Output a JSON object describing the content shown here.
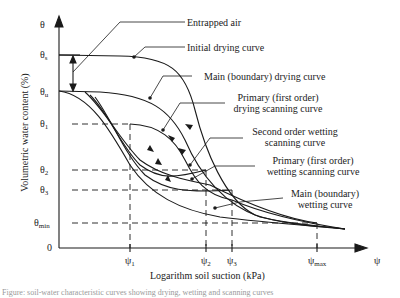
{
  "figure": {
    "y_axis_title": "Volumetric water content (%)",
    "x_axis_title": "Logarithm soil suction (kPa)",
    "y_ticks": [
      {
        "id": "theta",
        "base": "θ",
        "sub": ""
      },
      {
        "id": "theta_s",
        "base": "θ",
        "sub": "s"
      },
      {
        "id": "theta_u",
        "base": "θ",
        "sub": "u"
      },
      {
        "id": "theta_1",
        "base": "θ",
        "sub": "1"
      },
      {
        "id": "theta_2",
        "base": "θ",
        "sub": "2"
      },
      {
        "id": "theta_3",
        "base": "θ",
        "sub": "3"
      },
      {
        "id": "theta_min",
        "base": "θ",
        "sub": "min"
      },
      {
        "id": "zero",
        "base": "0",
        "sub": ""
      }
    ],
    "x_ticks": [
      {
        "id": "psi_1",
        "base": "ψ",
        "sub": "1"
      },
      {
        "id": "psi_2",
        "base": "ψ",
        "sub": "2"
      },
      {
        "id": "psi_3",
        "base": "ψ",
        "sub": "3"
      },
      {
        "id": "psi_max",
        "base": "ψ",
        "sub": "max"
      },
      {
        "id": "psi",
        "base": "ψ",
        "sub": ""
      }
    ],
    "annotations": {
      "entrapped_air": "Entrapped air",
      "initial_drying": "Initial drying curve",
      "main_drying": "Main (boundary) drying curve",
      "primary_drying_1": "Primary (first order)",
      "primary_drying_2": "drying scanning curve",
      "second_wetting_1": "Second order wetting",
      "second_wetting_2": "scanning curve",
      "primary_wetting_1": "Primary (first order)",
      "primary_wetting_2": "wetting scanning curve",
      "main_wetting_1": "Main (boundary)",
      "main_wetting_2": "wetting curve"
    },
    "caption": "Figure: soil-water characteristic curves showing drying, wetting and scanning curves"
  },
  "colors": {
    "ink": "#1a1a1a",
    "background": "#ffffff"
  }
}
